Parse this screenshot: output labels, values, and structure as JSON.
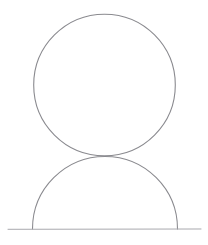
{
  "figure": {
    "title": "Circle resting on a semicircle over a ground line",
    "canvas": {
      "width": 208,
      "height": 245,
      "background_color": "#ffffff"
    },
    "style": {
      "stroke_color": "#8a8a8f",
      "stroke_color_light": "#a9a9ae",
      "stroke_width": 1.1,
      "baseline_stroke_width": 1.0,
      "medium": "pencil"
    },
    "shapes": [
      {
        "name": "upper-circle",
        "type": "circle",
        "center_x": 104.5,
        "center_y": 85.0,
        "radius": 70.8,
        "left_x": 33.7,
        "right_x": 175.3,
        "top_y": 14.2,
        "bottom_y": 155.8,
        "stroke_color": "#8a8a8f"
      },
      {
        "name": "lower-semicircle",
        "type": "semicircle",
        "center_x": 105.0,
        "center_y": 229.0,
        "radius": 72.5,
        "left_x": 32.5,
        "right_x": 177.5,
        "apex_y": 156.5,
        "base_y": 229.0,
        "opens": "downward",
        "stroke_color": "#8a8a8f"
      },
      {
        "name": "ground-baseline",
        "type": "line",
        "x1": 8.0,
        "y1": 229.3,
        "x2": 201.0,
        "y2": 229.0,
        "stroke_color": "#a9a9ae"
      }
    ],
    "contact_points": [
      {
        "name": "circle-semicircle-tangency",
        "x": 104.8,
        "y": 156.0
      },
      {
        "name": "semicircle-left-foot",
        "x": 32.5,
        "y": 229.0
      },
      {
        "name": "semicircle-right-foot",
        "x": 177.5,
        "y": 229.0
      }
    ]
  }
}
